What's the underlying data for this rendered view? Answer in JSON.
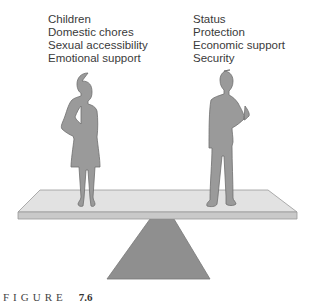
{
  "figure": {
    "left_labels": [
      "Children",
      "Domestic chores",
      "Sexual accessibility",
      "Emotional support"
    ],
    "right_labels": [
      "Status",
      "Protection",
      "Economic support",
      "Security"
    ],
    "caption": {
      "word": "FIGURE",
      "number": "7.6"
    },
    "colors": {
      "figure_fill": "#9a9a9a",
      "figure_outline": "#6e6e6e",
      "plank_top": "#e2e2e2",
      "plank_edge": "#c4c4c4",
      "fulcrum": "#8f8f8f",
      "text": "#3a3a3a"
    }
  }
}
